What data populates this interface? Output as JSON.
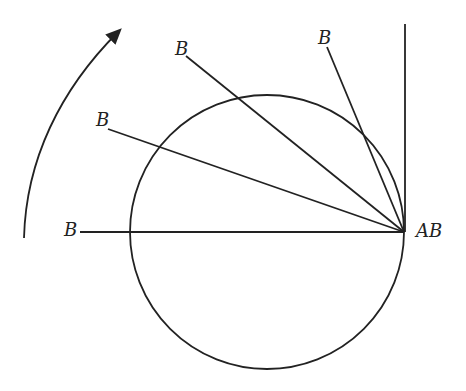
{
  "diagram": {
    "labels": {
      "b1": "B",
      "b2": "B",
      "b3": "B",
      "b4": "B",
      "ab": "AB"
    }
  }
}
